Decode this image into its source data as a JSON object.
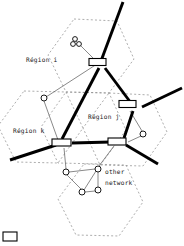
{
  "figure": {
    "type": "network-topology-diagram",
    "width": 184,
    "height": 246,
    "background": "#ffffff"
  },
  "colors": {
    "backbone_link": "#000000",
    "access_link": "#6b6b6b",
    "region_boundary": "#8a8a8a",
    "node_fill": "#ffffff",
    "node_stroke": "#000000",
    "text": "#1a1a1a"
  },
  "regions": [
    {
      "id": "region-i",
      "label": "Région i",
      "label_x": 26,
      "label_y": 60
    },
    {
      "id": "region-j",
      "label": "Région j",
      "label_x": 88,
      "label_y": 117
    },
    {
      "id": "region-k",
      "label": "Région k",
      "label_x": 14,
      "label_y": 133
    }
  ],
  "annotations": [
    {
      "id": "other-network",
      "line1": "other",
      "line2": "network",
      "x": 104,
      "y": 174
    }
  ],
  "routers": [
    {
      "id": "router-top",
      "x": 97,
      "y": 62,
      "w": 17,
      "h": 7
    },
    {
      "id": "router-right",
      "x": 127,
      "y": 104,
      "w": 17,
      "h": 7
    },
    {
      "id": "router-left",
      "x": 55,
      "y": 141,
      "w": 19,
      "h": 7
    },
    {
      "id": "router-center",
      "x": 110,
      "y": 139,
      "w": 18,
      "h": 7
    }
  ],
  "hosts": [
    {
      "id": "host-top-a",
      "x": 75,
      "y": 39,
      "r": 2.4
    },
    {
      "id": "host-top-b",
      "x": 73,
      "y": 44,
      "r": 2.4
    },
    {
      "id": "host-top-c",
      "x": 79,
      "y": 44,
      "r": 2.4
    },
    {
      "id": "host-left",
      "x": 44,
      "y": 98,
      "r": 3.0
    },
    {
      "id": "host-right",
      "x": 143,
      "y": 134,
      "r": 3.0
    },
    {
      "id": "host-net-left",
      "x": 66,
      "y": 172,
      "r": 3.0
    },
    {
      "id": "host-net-right",
      "x": 98,
      "y": 169,
      "r": 3.0
    },
    {
      "id": "host-net-bottom",
      "x": 82,
      "y": 192,
      "r": 3.0
    },
    {
      "id": "host-net-br",
      "x": 98,
      "y": 190,
      "r": 3.0
    }
  ],
  "legend": {
    "swatch": {
      "x": 3,
      "y": 232,
      "w": 14,
      "h": 9
    },
    "visible_text": ""
  }
}
